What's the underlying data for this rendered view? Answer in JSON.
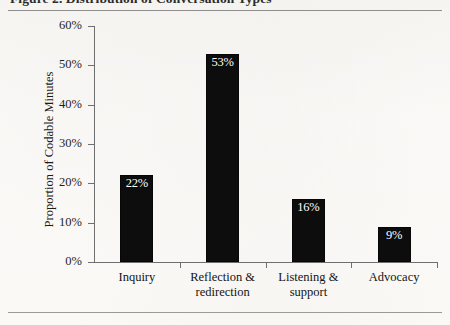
{
  "figure": {
    "caption": "Figure 2.  Distribution of Conversation Types",
    "background_color": "#fbfbf9",
    "bar_color": "#0d0d0d",
    "axis_color": "#6f6f6f",
    "label_color": "#ffffff"
  },
  "chart_data": {
    "type": "bar",
    "title": "",
    "xlabel": "",
    "ylabel": "Proportion of Codable Minutes",
    "categories": [
      "Inquiry",
      "Reflection & redirection",
      "Listening & support",
      "Advocacy"
    ],
    "category_lines": [
      [
        "Inquiry"
      ],
      [
        "Reflection &",
        "redirection"
      ],
      [
        "Listening &",
        "support"
      ],
      [
        "Advocacy"
      ]
    ],
    "values": [
      22,
      53,
      16,
      9
    ],
    "value_labels": [
      "22%",
      "53%",
      "16%",
      "9%"
    ],
    "ylim": [
      0,
      60
    ],
    "ytick_values": [
      60,
      50,
      40,
      30,
      20,
      10,
      0
    ],
    "ytick_labels": [
      "60%",
      "50%",
      "40%",
      "30%",
      "20%",
      "10%",
      "0%"
    ],
    "grid": false,
    "legend": "none",
    "bar_label_position": "inside-top"
  }
}
